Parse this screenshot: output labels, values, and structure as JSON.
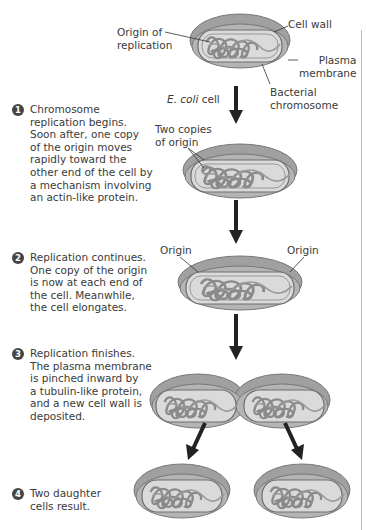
{
  "figure": {
    "labels": {
      "origin_of_replication": "Origin of\nreplication",
      "origin_line1": "Origin of",
      "origin_line2": "replication",
      "cell_wall": "Cell wall",
      "plasma_line1": "Plasma",
      "plasma_line2": "membrane",
      "bact_line1": "Bacterial",
      "bact_line2": "chromosome",
      "ecoli_italic": "E. coli",
      "ecoli_rest": " cell",
      "two_copies_line1": "Two copies",
      "two_copies_line2": "of origin",
      "origin_left": "Origin",
      "origin_right": "Origin"
    },
    "steps": [
      {
        "number": "1",
        "text": "Chromosome\nreplication begins.\nSoon after, one copy\nof the origin moves\nrapidly toward the\nother end of the cell by\na mechanism involving\nan actin-like protein."
      },
      {
        "number": "2",
        "text": "Replication continues.\nOne copy of the origin\nis now at each end of\nthe cell. Meanwhile,\nthe cell elongates."
      },
      {
        "number": "3",
        "text": "Replication finishes.\nThe plasma membrane\nis pinched inward by\na tubulin-like protein,\nand a new cell wall is\ndeposited."
      },
      {
        "number": "4",
        "text": "Two daughter\ncells result."
      }
    ],
    "colors": {
      "cell_wall": "#8c8c8c",
      "cell_outer": "#a8a8a8",
      "membrane": "#6e6e6e",
      "cytoplasm": "#d9d9d9",
      "chromosome": "#8a8a8a",
      "arrow": "#222222"
    }
  }
}
